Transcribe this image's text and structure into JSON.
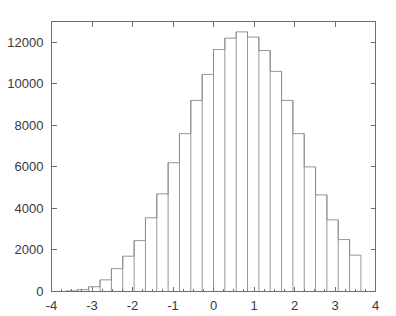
{
  "figure": {
    "background": "#ffffff",
    "axis_color": "#6e6e6e",
    "bar_edge_color": "#8a8a8a",
    "bar_fill_color": "#ffffff",
    "tick_label_color": "#3a3a3a"
  },
  "chart_data": {
    "type": "bar",
    "title": "",
    "subtitle": "",
    "xlabel": "",
    "ylabel": "",
    "legend": [],
    "grid": false,
    "histogram": true,
    "bin_width": 0.28,
    "bin_edges": [
      -3.64,
      -3.36,
      -3.08,
      -2.8,
      -2.52,
      -2.24,
      -1.96,
      -1.68,
      -1.4,
      -1.12,
      -0.84,
      -0.56,
      -0.28,
      0.0,
      0.28,
      0.56,
      0.84,
      1.12,
      1.4,
      1.68,
      1.96,
      2.24,
      2.52,
      2.8,
      3.08,
      3.36,
      3.64
    ],
    "categories": [
      "-3.50",
      "-3.22",
      "-2.94",
      "-2.66",
      "-2.38",
      "-2.10",
      "-1.82",
      "-1.54",
      "-1.26",
      "-0.98",
      "-0.70",
      "-0.42",
      "-0.14",
      "0.14",
      "0.42",
      "0.70",
      "0.98",
      "1.26",
      "1.54",
      "1.82",
      "2.10",
      "2.38",
      "2.66",
      "2.94",
      "3.22",
      "3.50"
    ],
    "values": [
      30,
      90,
      230,
      560,
      1100,
      1700,
      2450,
      3550,
      4700,
      6200,
      7600,
      9200,
      10450,
      11650,
      12200,
      12500,
      12250,
      11600,
      10600,
      9200,
      7600,
      6000,
      4650,
      3450,
      2500,
      1750
    ],
    "values_right_tail": [
      1150,
      750,
      420,
      200,
      80,
      25
    ],
    "x": [
      -3.5,
      -3.22,
      -2.94,
      -2.66,
      -2.38,
      -2.1,
      -1.82,
      -1.54,
      -1.26,
      -0.98,
      -0.7,
      -0.42,
      -0.14,
      0.14,
      0.42,
      0.7,
      0.98,
      1.26,
      1.54,
      1.82,
      2.1,
      2.38,
      2.66,
      2.94,
      3.22,
      3.5
    ],
    "xlim": [
      -4,
      4
    ],
    "ylim": [
      0,
      13000
    ],
    "xticks": [
      -4,
      -3,
      -2,
      -1,
      0,
      1,
      2,
      3,
      4
    ],
    "xtick_labels": [
      "-4",
      "-3",
      "-2",
      "-1",
      "0",
      "1",
      "2",
      "3",
      "4"
    ],
    "yticks": [
      0,
      2000,
      4000,
      6000,
      8000,
      10000,
      12000
    ],
    "ytick_labels": [
      "0",
      "2000",
      "4000",
      "6000",
      "8000",
      "10000",
      "12000"
    ],
    "x_minor_tick_step": 0.25,
    "peak_value": 12500,
    "peak_x": 0.14,
    "total_count": 100000,
    "distribution": "normal"
  }
}
